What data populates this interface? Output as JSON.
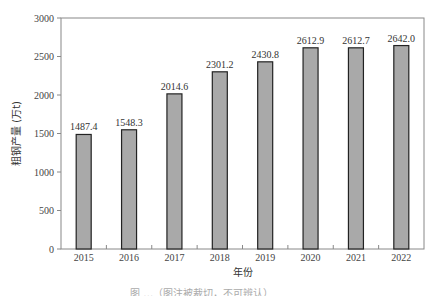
{
  "chart_data": {
    "type": "bar",
    "title": "",
    "xlabel": "年份",
    "ylabel": "粗钢产量 (万t)",
    "categories": [
      "2015",
      "2016",
      "2017",
      "2018",
      "2019",
      "2020",
      "2021",
      "2022"
    ],
    "values": [
      1487.4,
      1548.3,
      2014.6,
      2301.2,
      2430.8,
      2612.9,
      2612.7,
      2642.0
    ],
    "value_labels": [
      "1487.4",
      "1548.3",
      "2014.6",
      "2301.2",
      "2430.8",
      "2612.9",
      "2612.7",
      "2642.0"
    ],
    "ylim": [
      0,
      3000
    ],
    "yticks": [
      0,
      500,
      1000,
      1500,
      2000,
      2500,
      3000
    ],
    "grid": false,
    "legend": null,
    "colors": {
      "bar_fill": "#a9a9a9",
      "bar_edge": "#222222",
      "axis": "#888888"
    }
  },
  "caption": {
    "text": "图 …（图注被裁切，不可辨认）"
  }
}
